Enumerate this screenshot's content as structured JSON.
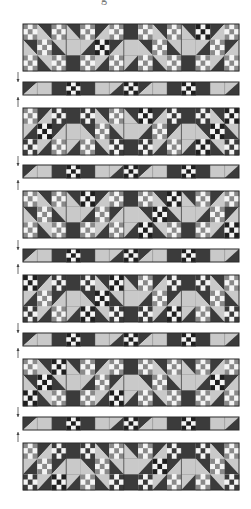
{
  "figure": {
    "title_fragment": "g",
    "colors": {
      "dark": "#3b3b3b",
      "light": "#c9c9c9",
      "medium": "#8a8a8a",
      "white": "#f4f4f4",
      "black": "#1e1e1e",
      "outline": "#2a2a2a"
    },
    "layout": {
      "left": 23,
      "width": 216,
      "block_row_height": 47,
      "strip_height": 13,
      "block_row_tops": [
        24,
        108,
        191,
        275,
        359,
        443
      ],
      "strip_tops": [
        82,
        165,
        249,
        333,
        417
      ]
    },
    "block_row": {
      "columns": [
        "block",
        "sash",
        "block",
        "sash",
        "block",
        "sash",
        "block"
      ],
      "block_diagonals": [
        [
          "/",
          "\\",
          "/",
          "\\"
        ],
        [
          "\\",
          "/",
          "\\",
          "/"
        ],
        [
          "/",
          "\\",
          "/",
          "\\"
        ],
        [
          "\\",
          "/",
          "\\",
          "/"
        ],
        [
          "/",
          "\\",
          "/",
          "\\"
        ],
        [
          "\\",
          "/",
          "\\",
          "/"
        ]
      ]
    },
    "strip": {
      "cells": [
        "hst-dl",
        "light",
        "dark",
        "ninepatch",
        "dark",
        "light",
        "hst-ld",
        "ninepatch",
        "hst-dl",
        "light",
        "dark",
        "ninepatch",
        "dark",
        "light",
        "hst-ld"
      ]
    },
    "markers": [
      {
        "type": "arrow-down",
        "y": 72
      },
      {
        "type": "arrow-up",
        "y": 97
      },
      {
        "type": "arrow-down",
        "y": 156
      },
      {
        "type": "arrow-up",
        "y": 180
      },
      {
        "type": "arrow-down",
        "y": 240
      },
      {
        "type": "arrow-up",
        "y": 264
      },
      {
        "type": "arrow-down",
        "y": 323
      },
      {
        "type": "arrow-up",
        "y": 348
      },
      {
        "type": "arrow-down",
        "y": 407
      },
      {
        "type": "arrow-up",
        "y": 432
      }
    ]
  }
}
